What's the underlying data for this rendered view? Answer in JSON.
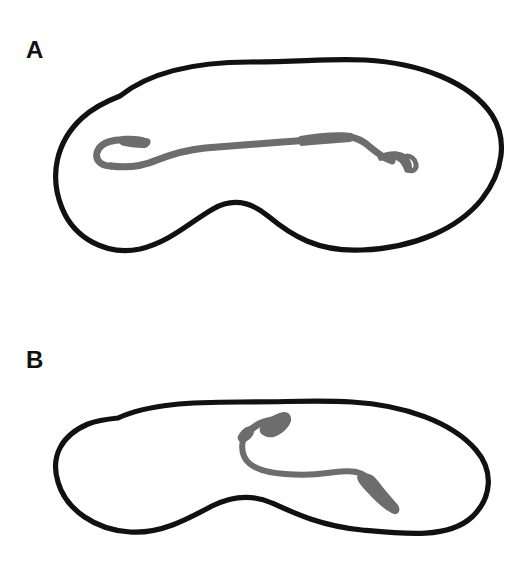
{
  "figure": {
    "type": "two-panel-schematic",
    "background_color": "#ffffff",
    "outline_color": "#111111",
    "trace_color": "#6d6d6d",
    "width": 530,
    "height": 584
  },
  "panels": [
    {
      "id": "A",
      "label": "A",
      "outline": {
        "name": "tissue-outline",
        "description": "closed peanut / kidney shaped contour with a concave notch along the lower edge",
        "stroke_color": "#111111",
        "stroke_width": 5.2,
        "bounds": {
          "left": 56,
          "top": 57,
          "right": 501,
          "bottom": 252
        }
      },
      "trace": {
        "name": "fiber-trace",
        "description": "long nearly horizontal gray fiber spanning most of the contour width, hooked recurved tip at left end, small upturned knob at right end",
        "color": "#6d6d6d",
        "bounds": {
          "left": 96,
          "top": 128,
          "right": 417,
          "bottom": 176
        },
        "length_fraction_of_outline": 0.72
      }
    },
    {
      "id": "B",
      "label": "B",
      "outline": {
        "name": "tissue-outline",
        "description": "closed peanut / kidney shaped contour, slightly flatter than panel A, with a concave notch along the lower edge",
        "stroke_color": "#111111",
        "stroke_width": 5.2,
        "bounds": {
          "left": 52,
          "top": 399,
          "right": 496,
          "bottom": 534
        }
      },
      "trace": {
        "name": "fiber-trace",
        "description": "shorter S-curved gray fiber confined to the right-central region, thickened club-like terminals at both ends, upper end bends up and left",
        "color": "#6d6d6d",
        "bounds": {
          "left": 236,
          "top": 421,
          "right": 400,
          "bottom": 512
        },
        "length_fraction_of_outline": 0.38
      }
    }
  ]
}
